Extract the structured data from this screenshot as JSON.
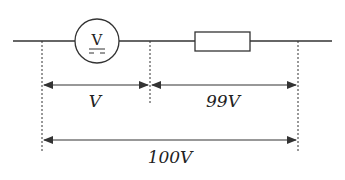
{
  "diagram": {
    "type": "circuit-voltage-division",
    "components": [
      {
        "id": "voltmeter",
        "symbol_text": "V",
        "kind": "voltmeter (DC)"
      },
      {
        "id": "resistor",
        "kind": "resistor"
      }
    ],
    "dimensions": [
      {
        "id": "voltmeter-voltage",
        "label": "V"
      },
      {
        "id": "resistor-voltage",
        "label": "99V"
      },
      {
        "id": "total-voltage",
        "label": "100V"
      }
    ],
    "colors": {
      "line": "#333333",
      "background": "#ffffff"
    }
  }
}
